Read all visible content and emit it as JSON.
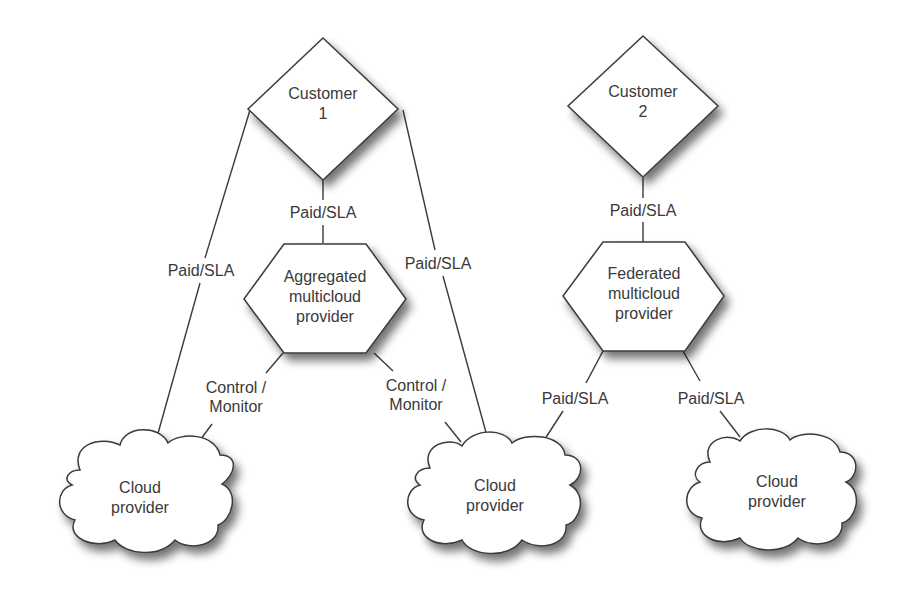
{
  "nodes": {
    "customer1": {
      "type": "diamond",
      "line1": "Customer",
      "line2": "1"
    },
    "customer2": {
      "type": "diamond",
      "line1": "Customer",
      "line2": "2"
    },
    "aggregated": {
      "type": "hexagon",
      "line1": "Aggregated",
      "line2": "multicloud",
      "line3": "provider"
    },
    "federated": {
      "type": "hexagon",
      "line1": "Federated",
      "line2": "multicloud",
      "line3": "provider"
    },
    "cloud_left": {
      "type": "cloud",
      "line1": "Cloud",
      "line2": "provider"
    },
    "cloud_middle": {
      "type": "cloud",
      "line1": "Cloud",
      "line2": "provider"
    },
    "cloud_right": {
      "type": "cloud",
      "line1": "Cloud",
      "line2": "provider"
    }
  },
  "edges": {
    "c1_to_aggregated": {
      "from": "customer1",
      "to": "aggregated",
      "label": "Paid/SLA"
    },
    "c1_to_cloud_left": {
      "from": "customer1",
      "to": "cloud_left",
      "label": "Paid/SLA"
    },
    "c1_to_cloud_middle": {
      "from": "customer1",
      "to": "cloud_middle",
      "label": "Paid/SLA"
    },
    "aggregated_to_cloud_left": {
      "from": "aggregated",
      "to": "cloud_left",
      "label_line1": "Control /",
      "label_line2": "Monitor"
    },
    "aggregated_to_cloud_middle": {
      "from": "aggregated",
      "to": "cloud_middle",
      "label_line1": "Control /",
      "label_line2": "Monitor"
    },
    "c2_to_federated": {
      "from": "customer2",
      "to": "federated",
      "label": "Paid/SLA"
    },
    "federated_to_cloud_middle": {
      "from": "federated",
      "to": "cloud_middle",
      "label": "Paid/SLA"
    },
    "federated_to_cloud_right": {
      "from": "federated",
      "to": "cloud_right",
      "label": "Paid/SLA"
    }
  },
  "colors": {
    "stroke": "#3a3a3a",
    "fill": "#ffffff",
    "shadow": "#9a9a9a",
    "text": "#3a3a3a"
  }
}
